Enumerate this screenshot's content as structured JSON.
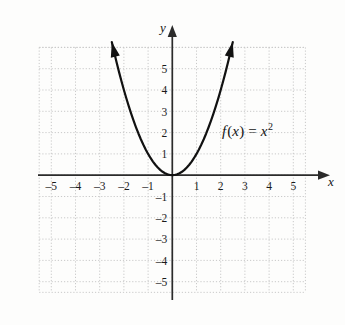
{
  "figure": {
    "name": "parabola-graph",
    "background_color": "#fdfdfc",
    "curve_color": "#111111",
    "axis_color": "#2b2b2b",
    "grid_color": "#c9c9c9"
  },
  "labels": {
    "x_axis_name": "x",
    "y_axis_name": "y",
    "function_prefix": "f",
    "function_open": "(",
    "function_var": "x",
    "function_close": ")",
    "function_equals": "=",
    "function_base": "x",
    "function_exponent": "2",
    "function_full": "f(x) = x²"
  },
  "chart_data": {
    "type": "line",
    "title": "",
    "subtitle": "",
    "xlabel": "x",
    "ylabel": "y",
    "xlim": [
      -5.6,
      5.9
    ],
    "xlim_grid": [
      -5.5,
      5.5
    ],
    "ylim": [
      -5.9,
      5.9
    ],
    "ylim_grid": [
      -5.5,
      6.0
    ],
    "grid": true,
    "grid_style": "dotted",
    "grid_step": 1,
    "legend": "none",
    "annotations": [
      {
        "text": "f(x) = x²",
        "x": 2.3,
        "y": 2.0
      }
    ],
    "xticks": [
      -5,
      -4,
      -3,
      -2,
      -1,
      1,
      2,
      3,
      4,
      5
    ],
    "xticklabels": [
      "–5",
      "–4",
      "–3",
      "–2",
      "–1",
      "1",
      "2",
      "3",
      "4",
      "5"
    ],
    "yticks": [
      5,
      4,
      3,
      2,
      1,
      -1,
      -2,
      -3,
      -4,
      -5
    ],
    "yticklabels": [
      "5",
      "4",
      "3",
      "2",
      "1",
      "–1",
      "–2",
      "–3",
      "–4",
      "–5"
    ],
    "series": [
      {
        "name": "f(x) = x²",
        "equation": "y = x^2",
        "arrowheads": [
          "start",
          "end"
        ],
        "x": [
          -2.5,
          -2.4,
          -2.3,
          -2.2,
          -2.1,
          -2.0,
          -1.9,
          -1.8,
          -1.7,
          -1.6,
          -1.5,
          -1.4,
          -1.3,
          -1.2,
          -1.1,
          -1.0,
          -0.9,
          -0.8,
          -0.7,
          -0.6,
          -0.5,
          -0.4,
          -0.3,
          -0.2,
          -0.1,
          0.0,
          0.1,
          0.2,
          0.3,
          0.4,
          0.5,
          0.6,
          0.7,
          0.8,
          0.9,
          1.0,
          1.1,
          1.2,
          1.3,
          1.4,
          1.5,
          1.6,
          1.7,
          1.8,
          1.9,
          2.0,
          2.1,
          2.2,
          2.3,
          2.4,
          2.5
        ],
        "y": [
          6.25,
          5.76,
          5.29,
          4.84,
          4.41,
          4.0,
          3.61,
          3.24,
          2.89,
          2.56,
          2.25,
          1.96,
          1.69,
          1.44,
          1.21,
          1.0,
          0.81,
          0.64,
          0.49,
          0.36,
          0.25,
          0.16,
          0.09,
          0.04,
          0.01,
          0.0,
          0.01,
          0.04,
          0.09,
          0.16,
          0.25,
          0.36,
          0.49,
          0.64,
          0.81,
          1.0,
          1.21,
          1.44,
          1.69,
          1.96,
          2.25,
          2.56,
          2.89,
          3.24,
          3.61,
          4.0,
          4.41,
          4.84,
          5.29,
          5.76,
          6.25
        ]
      }
    ]
  }
}
